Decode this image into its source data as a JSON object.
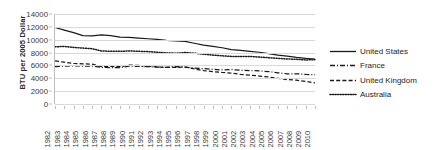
{
  "chart_data": {
    "type": "line",
    "title": "",
    "xlabel": "",
    "ylabel": "BTU per 2005 Dollar",
    "ylim": [
      0,
      14000
    ],
    "ytick_labels": [
      "14000",
      "12000",
      "10000",
      "8000",
      "6000",
      "4000",
      "2000",
      "0"
    ],
    "yticks": [
      14000,
      12000,
      10000,
      8000,
      6000,
      4000,
      2000,
      0
    ],
    "grid": true,
    "legend_position": "right",
    "categories": [
      "1982",
      "1983",
      "1984",
      "1985",
      "1986",
      "1987",
      "1988",
      "1989",
      "1990",
      "1991",
      "1992",
      "1993",
      "1994",
      "1995",
      "1996",
      "1997",
      "1998",
      "1999",
      "2000",
      "2001",
      "2002",
      "2003",
      "2004",
      "2005",
      "2006",
      "2007",
      "2008",
      "2009",
      "2010"
    ],
    "series": [
      {
        "name": "United States",
        "style": "solid",
        "color": "#1a1a1a",
        "values": [
          11900,
          11500,
          11100,
          10650,
          10600,
          10750,
          10650,
          10400,
          10350,
          10250,
          10150,
          10050,
          9900,
          9800,
          9750,
          9450,
          9150,
          8950,
          8750,
          8450,
          8350,
          8200,
          8050,
          7850,
          7600,
          7450,
          7250,
          7100,
          7000
        ]
      },
      {
        "name": "France",
        "style": "dashdot",
        "color": "#1a1a1a",
        "values": [
          5800,
          5900,
          5950,
          5900,
          5900,
          5700,
          5650,
          5650,
          5900,
          5850,
          5800,
          5750,
          5700,
          5800,
          5750,
          5600,
          5500,
          5400,
          5300,
          5350,
          5250,
          5200,
          5150,
          5050,
          4850,
          4700,
          4700,
          4600,
          4550
        ]
      },
      {
        "name": "United Kingdom",
        "style": "dashed",
        "color": "#1a1a1a",
        "values": [
          6700,
          6500,
          6300,
          6250,
          6200,
          5800,
          5850,
          5800,
          6050,
          6000,
          5900,
          5750,
          5700,
          5700,
          5750,
          5450,
          5200,
          5050,
          4900,
          4800,
          4600,
          4500,
          4350,
          4200,
          4000,
          3800,
          3700,
          3500,
          3300
        ]
      },
      {
        "name": "Australia",
        "style": "dotted",
        "color": "#1a1a1a",
        "values": [
          8900,
          8950,
          8800,
          8700,
          8600,
          8250,
          8200,
          8200,
          8250,
          8200,
          8150,
          8050,
          7950,
          7900,
          8000,
          7900,
          7750,
          7600,
          7500,
          7400,
          7400,
          7400,
          7300,
          7200,
          7100,
          7000,
          6950,
          6850,
          6900
        ]
      }
    ]
  },
  "legend": {
    "items": [
      {
        "label": "United States",
        "style": "solid"
      },
      {
        "label": "France",
        "style": "dashdot"
      },
      {
        "label": "United Kingdom",
        "style": "dashed"
      },
      {
        "label": "Australia",
        "style": "dotted"
      }
    ]
  }
}
